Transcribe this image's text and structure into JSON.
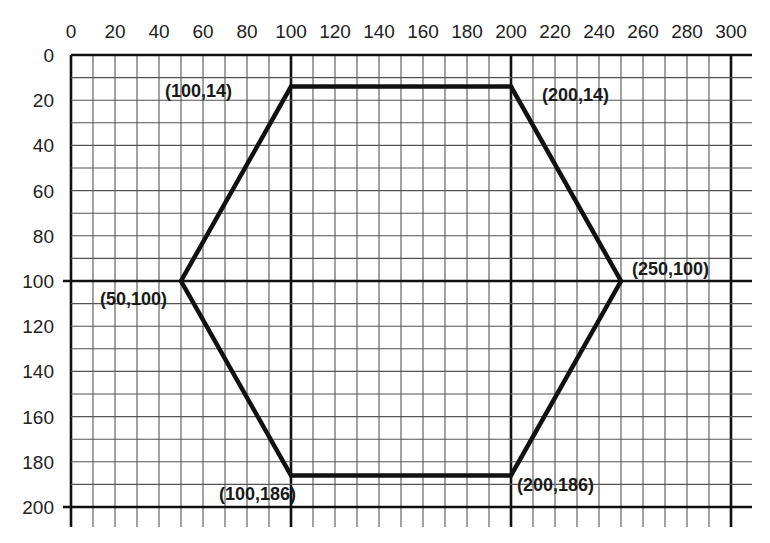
{
  "chart_data": {
    "type": "line",
    "title": "",
    "xlabel": "",
    "ylabel": "",
    "xlim": [
      0,
      300
    ],
    "ylim": [
      0,
      200
    ],
    "y_inverted": true,
    "grid": true,
    "grid_step": 10,
    "x_ticks": [
      0,
      20,
      40,
      60,
      80,
      100,
      120,
      140,
      160,
      180,
      200,
      220,
      240,
      260,
      280,
      300
    ],
    "y_ticks": [
      0,
      20,
      40,
      60,
      80,
      100,
      120,
      140,
      160,
      180,
      200
    ],
    "heavy_lines": {
      "x": [
        0,
        100,
        200,
        300
      ],
      "y": [
        0,
        100,
        200
      ]
    },
    "series": [
      {
        "name": "hexagon",
        "closed": true,
        "points": [
          {
            "x": 100,
            "y": 14,
            "label": "(100,14)"
          },
          {
            "x": 200,
            "y": 14,
            "label": "(200,14)"
          },
          {
            "x": 250,
            "y": 100,
            "label": "(250,100)"
          },
          {
            "x": 200,
            "y": 186,
            "label": "(200,186)"
          },
          {
            "x": 100,
            "y": 186,
            "label": "(100,186)"
          },
          {
            "x": 50,
            "y": 100,
            "label": "(50,100)"
          }
        ]
      }
    ]
  },
  "labels": {
    "p1": "(100,14)",
    "p2": "(200,14)",
    "p3": "(250,100)",
    "p4": "(200,186)",
    "p5": "(100,186)",
    "p6": "(50,100)"
  },
  "colors": {
    "line": "#111111",
    "grid": "#444444",
    "background": "#ffffff"
  }
}
